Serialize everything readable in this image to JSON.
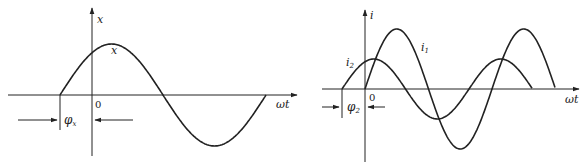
{
  "left_diagram": {
    "y_axis_label": "x",
    "x_axis_label": "ωt",
    "origin_label": "0",
    "curve_label": "x",
    "phase_label": "φ",
    "phase_subscript": "x"
  },
  "right_diagram": {
    "y_axis_label": "i",
    "x_axis_label": "ωt",
    "origin_label": "0",
    "curve1_label": "i",
    "curve1_subscript": "1",
    "curve2_label": "i",
    "curve2_subscript": "2",
    "phase_label": "φ",
    "phase_subscript": "2"
  },
  "colors": {
    "line": "#222222",
    "background": "#ffffff"
  }
}
